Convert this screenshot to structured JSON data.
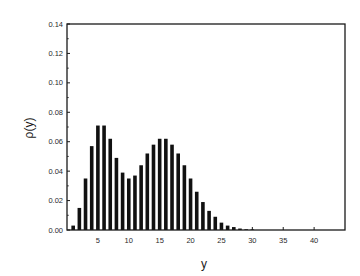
{
  "chart_data": {
    "type": "bar",
    "title": "",
    "xlabel": "y",
    "ylabel": "ρ(y)",
    "xlim": [
      0,
      45
    ],
    "ylim": [
      0,
      0.14
    ],
    "grid": false,
    "legend": null,
    "x_ticks": [
      5,
      10,
      15,
      20,
      25,
      30,
      35,
      40
    ],
    "x_tick_labels": [
      "5",
      "10",
      "15",
      "20",
      "25",
      "30",
      "35",
      "40"
    ],
    "y_ticks": [
      0.0,
      0.02,
      0.04,
      0.06,
      0.08,
      0.1,
      0.12,
      0.14
    ],
    "y_tick_labels": [
      "0.00",
      "0.02",
      "0.04",
      "0.06",
      "0.08",
      "0.10",
      "0.12",
      "0.14"
    ],
    "bar_color": "#111111",
    "x": [
      1,
      2,
      3,
      4,
      5,
      6,
      7,
      8,
      9,
      10,
      11,
      12,
      13,
      14,
      15,
      16,
      17,
      18,
      19,
      20,
      21,
      22,
      23,
      24,
      25,
      26,
      27,
      28,
      29,
      30
    ],
    "values": [
      0.003,
      0.015,
      0.035,
      0.057,
      0.071,
      0.071,
      0.062,
      0.049,
      0.039,
      0.035,
      0.037,
      0.044,
      0.052,
      0.058,
      0.062,
      0.062,
      0.058,
      0.052,
      0.044,
      0.035,
      0.026,
      0.019,
      0.013,
      0.009,
      0.005,
      0.003,
      0.002,
      0.001,
      0.0005,
      0.0003
    ]
  }
}
